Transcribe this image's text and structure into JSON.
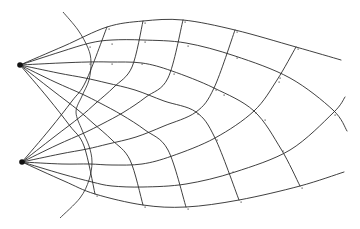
{
  "diagram": {
    "type": "ray-wavefront-grid",
    "colors": {
      "line": "#2a2a2a",
      "source": "#111111",
      "tick": "#555555",
      "background": "#ffffff"
    },
    "sources": [
      {
        "name": "upper-source",
        "x": 20,
        "y": 65
      },
      {
        "name": "lower-source",
        "x": 22,
        "y": 162
      }
    ],
    "outer_arc": [
      [
        63,
        12
      ],
      [
        78,
        30
      ],
      [
        88,
        48
      ],
      [
        91,
        62
      ],
      [
        89,
        80
      ],
      [
        82,
        96
      ],
      [
        76,
        112
      ],
      [
        82,
        130
      ],
      [
        89,
        146
      ],
      [
        92,
        162
      ],
      [
        89,
        180
      ],
      [
        80,
        198
      ],
      [
        60,
        218
      ]
    ],
    "rays_upper": [
      [
        [
          20,
          65
        ],
        [
          64,
          46
        ],
        [
          107,
          27
        ],
        [
          143,
          21
        ],
        [
          183,
          20
        ],
        [
          235,
          30
        ],
        [
          296,
          47
        ],
        [
          341,
          60
        ]
      ],
      [
        [
          20,
          65
        ],
        [
          60,
          52
        ],
        [
          90,
          43
        ],
        [
          112,
          40
        ],
        [
          143,
          40
        ],
        [
          186,
          43
        ],
        [
          235,
          56
        ],
        [
          290,
          78
        ],
        [
          333,
          110
        ],
        [
          347,
          131
        ]
      ],
      [
        [
          20,
          65
        ],
        [
          60,
          63
        ],
        [
          88,
          62
        ],
        [
          110,
          62
        ],
        [
          142,
          63
        ],
        [
          172,
          71
        ],
        [
          214,
          88
        ],
        [
          254,
          111
        ],
        [
          281,
          149
        ],
        [
          300,
          186
        ]
      ],
      [
        [
          20,
          65
        ],
        [
          58,
          73
        ],
        [
          85,
          78
        ],
        [
          107,
          83
        ],
        [
          135,
          90
        ],
        [
          164,
          101
        ],
        [
          196,
          112
        ],
        [
          215,
          138
        ],
        [
          239,
          200
        ]
      ],
      [
        [
          20,
          65
        ],
        [
          55,
          82
        ],
        [
          82,
          94
        ],
        [
          100,
          103
        ],
        [
          122,
          115
        ],
        [
          145,
          130
        ],
        [
          168,
          150
        ],
        [
          186,
          207
        ]
      ],
      [
        [
          20,
          65
        ],
        [
          52,
          90
        ],
        [
          78,
          110
        ],
        [
          94,
          124
        ],
        [
          112,
          140
        ],
        [
          130,
          160
        ],
        [
          143,
          205
        ]
      ],
      [
        [
          20,
          65
        ],
        [
          48,
          98
        ],
        [
          70,
          126
        ],
        [
          84,
          146
        ],
        [
          95,
          194
        ]
      ]
    ],
    "rays_lower": [
      [
        [
          22,
          162
        ],
        [
          64,
          181
        ],
        [
          95,
          194
        ],
        [
          143,
          205
        ],
        [
          186,
          207
        ],
        [
          239,
          200
        ],
        [
          300,
          186
        ],
        [
          344,
          172
        ]
      ],
      [
        [
          22,
          162
        ],
        [
          62,
          174
        ],
        [
          92,
          182
        ],
        [
          112,
          186
        ],
        [
          143,
          187
        ],
        [
          186,
          184
        ],
        [
          235,
          172
        ],
        [
          290,
          150
        ],
        [
          333,
          113
        ],
        [
          345,
          97
        ]
      ],
      [
        [
          22,
          162
        ],
        [
          62,
          164
        ],
        [
          90,
          164
        ],
        [
          112,
          165
        ],
        [
          142,
          164
        ],
        [
          172,
          156
        ],
        [
          215,
          138
        ],
        [
          254,
          111
        ],
        [
          277,
          80
        ],
        [
          296,
          47
        ]
      ],
      [
        [
          22,
          162
        ],
        [
          60,
          154
        ],
        [
          87,
          149
        ],
        [
          108,
          144
        ],
        [
          136,
          137
        ],
        [
          164,
          126
        ],
        [
          196,
          112
        ],
        [
          214,
          88
        ],
        [
          235,
          30
        ]
      ],
      [
        [
          22,
          162
        ],
        [
          57,
          145
        ],
        [
          84,
          133
        ],
        [
          102,
          124
        ],
        [
          124,
          112
        ],
        [
          146,
          97
        ],
        [
          168,
          78
        ],
        [
          183,
          20
        ]
      ],
      [
        [
          22,
          162
        ],
        [
          54,
          137
        ],
        [
          80,
          117
        ],
        [
          96,
          103
        ],
        [
          114,
          87
        ],
        [
          132,
          67
        ],
        [
          143,
          21
        ]
      ],
      [
        [
          22,
          162
        ],
        [
          50,
          129
        ],
        [
          72,
          101
        ],
        [
          86,
          81
        ],
        [
          107,
          27
        ]
      ]
    ],
    "tick_marks": [
      [
        88,
        45
      ],
      [
        110,
        42
      ],
      [
        143,
        40
      ],
      [
        186,
        44
      ],
      [
        235,
        56
      ],
      [
        278,
        76
      ],
      [
        88,
        62
      ],
      [
        110,
        62
      ],
      [
        140,
        62
      ],
      [
        172,
        72
      ],
      [
        222,
        93
      ],
      [
        263,
        118
      ],
      [
        214,
        88
      ],
      [
        277,
        80
      ],
      [
        196,
        112
      ],
      [
        254,
        111
      ],
      [
        333,
        113
      ],
      [
        215,
        138
      ],
      [
        281,
        149
      ],
      [
        231,
        170
      ],
      [
        95,
        194
      ],
      [
        143,
        205
      ],
      [
        186,
        207
      ],
      [
        239,
        200
      ],
      [
        300,
        186
      ],
      [
        107,
        27
      ],
      [
        143,
        21
      ],
      [
        183,
        20
      ],
      [
        235,
        30
      ],
      [
        296,
        47
      ]
    ]
  }
}
